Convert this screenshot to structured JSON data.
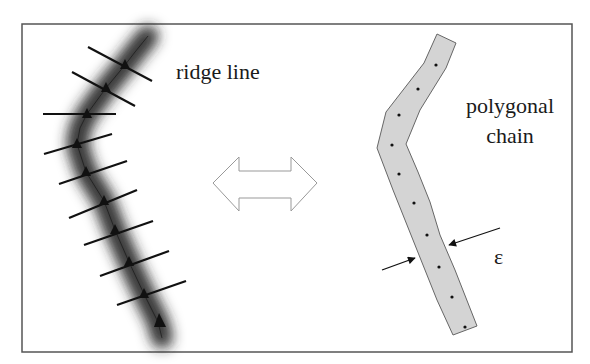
{
  "figure": {
    "frame": {
      "x": 22,
      "y": 24,
      "width": 550,
      "height": 328,
      "stroke": "#555555"
    },
    "left_panel": {
      "label": "ridge line",
      "label_pos": {
        "x": 176,
        "y": 79
      },
      "band_color": "#2a2a2a",
      "center_path": [
        [
          148,
          36
        ],
        [
          135,
          52
        ],
        [
          125,
          65
        ],
        [
          106,
          88
        ],
        [
          87,
          114
        ],
        [
          80,
          128
        ],
        [
          77,
          144
        ],
        [
          86,
          172
        ],
        [
          104,
          201
        ],
        [
          115,
          230
        ],
        [
          129,
          262
        ],
        [
          144,
          294
        ],
        [
          158,
          322
        ],
        [
          162,
          338
        ]
      ],
      "ticks": [
        {
          "x1": 88,
          "y1": 47,
          "x2": 152,
          "y2": 81
        },
        {
          "x1": 72,
          "y1": 72,
          "x2": 135,
          "y2": 106
        },
        {
          "x1": 43,
          "y1": 114,
          "x2": 116,
          "y2": 114
        },
        {
          "x1": 44,
          "y1": 154,
          "x2": 112,
          "y2": 134
        },
        {
          "x1": 59,
          "y1": 184,
          "x2": 127,
          "y2": 161
        },
        {
          "x1": 69,
          "y1": 218,
          "x2": 137,
          "y2": 190
        },
        {
          "x1": 84,
          "y1": 245,
          "x2": 153,
          "y2": 221
        },
        {
          "x1": 100,
          "y1": 276,
          "x2": 169,
          "y2": 251
        },
        {
          "x1": 117,
          "y1": 305,
          "x2": 186,
          "y2": 281
        }
      ],
      "nodes": [
        [
          125,
          65
        ],
        [
          106,
          88
        ],
        [
          87,
          114
        ],
        [
          77,
          144
        ],
        [
          86,
          172
        ],
        [
          104,
          201
        ],
        [
          115,
          230
        ],
        [
          129,
          262
        ],
        [
          144,
          294
        ]
      ],
      "end_marker": [
        160,
        322
      ]
    },
    "center_arrow": {
      "type": "double-headed outline arrow",
      "points": "213,183 239,157 239,171 291,171 291,157 317,183 291,211 291,198 239,198 239,211",
      "stroke": "#999999"
    },
    "right_panel": {
      "label_line1": "polygonal",
      "label_line2": "chain",
      "label_pos": {
        "x": 510,
        "y": 113
      },
      "fill": "#d4d4d4",
      "stroke": "#666666",
      "outline": "437,34 456,43 446,68 420,110 406,144 418,172 430,202 440,235 455,270 477,326 453,335 437,300 417,250 405,220 393,190 377,148 386,112 424,63",
      "dots": [
        [
          436,
          65
        ],
        [
          418,
          89
        ],
        [
          399,
          115
        ],
        [
          392,
          145
        ],
        [
          399,
          174
        ],
        [
          414,
          203
        ],
        [
          427,
          235
        ],
        [
          439,
          267
        ],
        [
          452,
          297
        ],
        [
          465,
          327
        ]
      ],
      "epsilon_label": "ε",
      "epsilon_pos": {
        "x": 494,
        "y": 264
      },
      "width_arrows": [
        {
          "from": [
            500,
            228
          ],
          "to": [
            449,
            245
          ]
        },
        {
          "from": [
            382,
            270
          ],
          "to": [
            415,
            258
          ]
        }
      ]
    }
  }
}
